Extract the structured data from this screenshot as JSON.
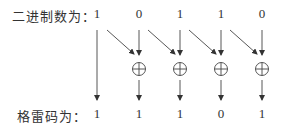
{
  "binary_row": {
    "label": "二进制数为：",
    "digits": [
      "1",
      "0",
      "1",
      "1",
      "0"
    ]
  },
  "gray_row": {
    "label": "格雷码为：",
    "digits": [
      "1",
      "1",
      "1",
      "0",
      "1"
    ]
  },
  "operator_symbol": "⊕",
  "colors": {
    "stroke": "#333333",
    "background": "#ffffff"
  }
}
